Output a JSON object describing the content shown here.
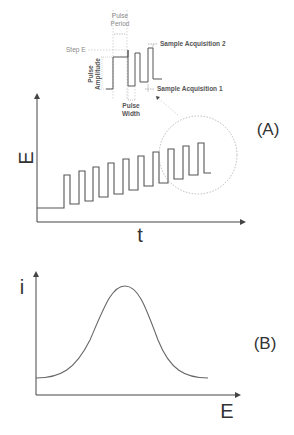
{
  "inset": {
    "pulse_period": [
      "Pulse",
      "Period"
    ],
    "step_e": "Step E",
    "pulse_amplitude": [
      "Pulse",
      "Amplitude"
    ],
    "pulse_width": [
      "Pulse",
      "Width"
    ],
    "sample_acq_1": "Sample Acquisition 1",
    "sample_acq_2": "Sample Acquisition 2"
  },
  "panel_a": {
    "label": "(A)",
    "ylabel": "E",
    "xlabel": "t",
    "waveform": "differential pulse staircase",
    "pulse_count": 9
  },
  "panel_b": {
    "label": "(B)",
    "ylabel": "i",
    "xlabel": "E",
    "curve": "peak-shaped current response"
  },
  "colors": {
    "line": "#555555",
    "dashed": "#aaaaaa",
    "text": "#333333"
  }
}
